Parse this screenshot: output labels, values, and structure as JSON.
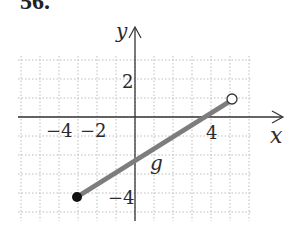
{
  "problem_number": "56.",
  "chart_data": {
    "type": "line",
    "title": "",
    "xlabel": "x",
    "ylabel": "y",
    "xlim": [
      -6.5,
      7
    ],
    "ylim": [
      -5,
      3
    ],
    "grid": true,
    "grid_style": "dotted",
    "x_ticks": [
      -4,
      -2,
      4
    ],
    "x_tick_labels": [
      "−4",
      "−2",
      "4"
    ],
    "y_ticks": [
      2,
      -4
    ],
    "y_tick_labels": [
      "2",
      "−4"
    ],
    "series": [
      {
        "name": "g",
        "x": [
          -3,
          5
        ],
        "y": [
          -4,
          1
        ],
        "start_point": {
          "x": -3,
          "y": -4,
          "style": "closed"
        },
        "end_point": {
          "x": 5,
          "y": 1,
          "style": "open"
        },
        "color": "#7a7a7a"
      }
    ],
    "annotations": [
      {
        "text": "g",
        "x": 1.5,
        "y": -2.5
      }
    ]
  }
}
